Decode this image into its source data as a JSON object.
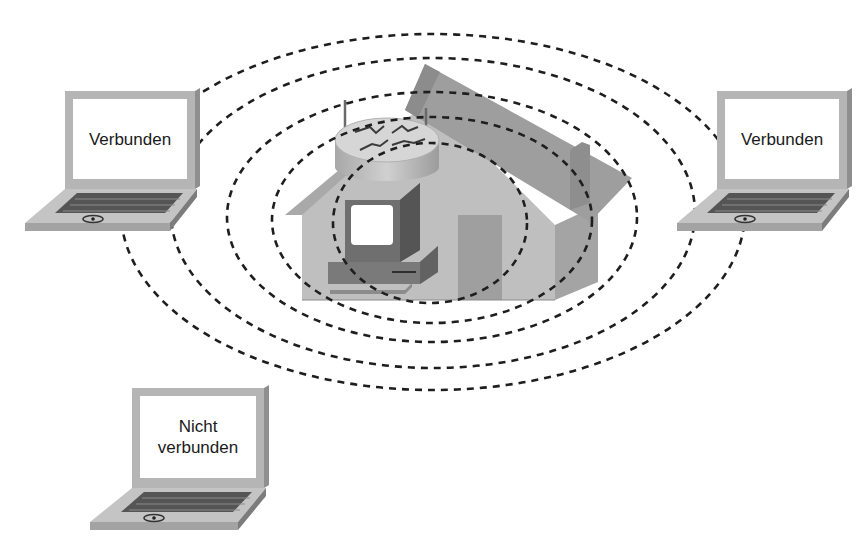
{
  "diagram": {
    "title": "",
    "access_point": {
      "label": "",
      "description": "House with wireless router and desktop computer at the center of the coverage area"
    },
    "coverage": {
      "rings": 5,
      "style": "dashed"
    },
    "laptops": [
      {
        "id": "left",
        "status_text": "Verbunden",
        "connected": true
      },
      {
        "id": "right",
        "status_text": "Verbunden",
        "connected": true
      },
      {
        "id": "bottom-left",
        "status_line1": "Nicht",
        "status_line2": "verbunden",
        "connected": false
      }
    ]
  },
  "colors": {
    "background": "#ffffff",
    "dash": "#1e1e1e",
    "house_front": "#bdbdbd",
    "house_side": "#a6a6a6",
    "roof": "#9a9a9a",
    "laptop_frame": "#b3b3b3",
    "keyboard": "#5e5e5e",
    "screen": "#ffffff"
  }
}
